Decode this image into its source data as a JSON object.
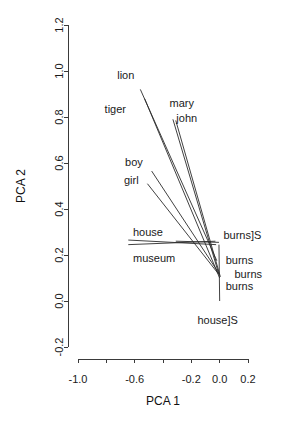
{
  "chart_data": {
    "type": "scatter",
    "title": "",
    "xlabel": "PCA 1",
    "ylabel": "PCA 2",
    "xlim": [
      -1.0,
      0.2
    ],
    "ylim": [
      -0.2,
      1.2
    ],
    "grid": false,
    "legend": "none",
    "xticks": [
      -1.0,
      -0.8,
      -0.6,
      -0.4,
      -0.2,
      0.0,
      0.2
    ],
    "xtick_labels": [
      "-1.0",
      "",
      "-0.6",
      "",
      "-0.2",
      "0.0",
      "0.2"
    ],
    "yticks": [
      -0.2,
      0.0,
      0.2,
      0.4,
      0.6,
      0.8,
      1.0,
      1.2
    ],
    "ytick_labels": [
      "-0.2",
      "0.0",
      "0.2",
      "0.4",
      "0.6",
      "0.8",
      "1.0",
      "1.2"
    ],
    "origin": {
      "x": -0.15,
      "y": 0.24
    },
    "points": [
      {
        "label": "lion",
        "x": -0.56,
        "y": 0.95,
        "label_dx": -6,
        "label_dy": -6,
        "anchor": "end",
        "vector_to": {
          "x": -0.06,
          "y": 0.13
        }
      },
      {
        "label": "tiger",
        "x": -0.53,
        "y": 0.91,
        "label_dx": -40,
        "label_dy": 18,
        "anchor": "start",
        "vector_to": {
          "x": -0.06,
          "y": 0.13
        }
      },
      {
        "label": "mary",
        "x": -0.34,
        "y": 0.82,
        "label_dx": -2,
        "label_dy": -8,
        "anchor": "start",
        "vector_to": {
          "x": -0.01,
          "y": 0.11
        }
      },
      {
        "label": "john",
        "x": -0.32,
        "y": 0.8,
        "label_dx": 2,
        "label_dy": 2,
        "anchor": "start",
        "vector_to": {
          "x": 0.0,
          "y": 0.1
        }
      },
      {
        "label": "boy",
        "x": -0.5,
        "y": 0.58,
        "label_dx": -6,
        "label_dy": -5,
        "anchor": "end",
        "vector_to": {
          "x": -0.02,
          "y": 0.14
        }
      },
      {
        "label": "girl",
        "x": -0.53,
        "y": 0.52,
        "label_dx": -6,
        "label_dy": 0,
        "anchor": "end",
        "vector_to": {
          "x": -0.02,
          "y": 0.12
        }
      },
      {
        "label": "house",
        "x": -0.64,
        "y": 0.27,
        "label_dx": 4,
        "label_dy": -6,
        "anchor": "start",
        "vector_to": {
          "x": -0.03,
          "y": 0.235
        }
      },
      {
        "label": "museum",
        "x": -0.64,
        "y": 0.25,
        "label_dx": 4,
        "label_dy": 16,
        "anchor": "start",
        "vector_to": {
          "x": -0.02,
          "y": 0.255
        }
      },
      {
        "label": "burns]S",
        "x": -0.03,
        "y": 0.265,
        "label_dx": 8,
        "label_dy": -4,
        "anchor": "start",
        "vector_to": null
      },
      {
        "label": "burns",
        "x": 0.0,
        "y": 0.19,
        "label_dx": 6,
        "label_dy": 4,
        "anchor": "start",
        "vector_to": null
      },
      {
        "label": "burns",
        "x": 0.02,
        "y": 0.13,
        "label_dx": 12,
        "label_dy": 4,
        "anchor": "start",
        "vector_to": null
      },
      {
        "label": "burns",
        "x": 0.0,
        "y": 0.08,
        "label_dx": 6,
        "label_dy": 4,
        "anchor": "start",
        "vector_to": null
      },
      {
        "label": "house]S",
        "x": 0.0,
        "y": -0.07,
        "label_dx": -2,
        "label_dy": 4,
        "anchor": "middle",
        "vector_to": null
      }
    ],
    "vectors": [
      {
        "name": "lion-vector",
        "x1": -0.56,
        "y1": 0.92,
        "x2": -0.02,
        "y2": 0.175
      },
      {
        "name": "tiger-vector",
        "x1": -0.53,
        "y1": 0.88,
        "x2": 0.0,
        "y2": 0.1
      },
      {
        "name": "mary-vector",
        "x1": -0.33,
        "y1": 0.79,
        "x2": -0.005,
        "y2": 0.115
      },
      {
        "name": "john-vector",
        "x1": -0.31,
        "y1": 0.785,
        "x2": 0.005,
        "y2": 0.105
      },
      {
        "name": "boy-vector",
        "x1": -0.48,
        "y1": 0.565,
        "x2": -0.005,
        "y2": 0.12
      },
      {
        "name": "girl-vector",
        "x1": -0.51,
        "y1": 0.51,
        "x2": -0.005,
        "y2": 0.115
      },
      {
        "name": "house-vector",
        "x1": -0.645,
        "y1": 0.265,
        "x2": -0.025,
        "y2": 0.245
      },
      {
        "name": "museum-vector",
        "x1": -0.645,
        "y1": 0.245,
        "x2": -0.03,
        "y2": 0.26
      },
      {
        "name": "burns-s-vector",
        "x1": -0.31,
        "y1": 0.26,
        "x2": -0.005,
        "y2": 0.255
      },
      {
        "name": "vertical-drop-vector",
        "x1": -0.005,
        "y1": 0.245,
        "x2": 0.0,
        "y2": 0.0
      }
    ]
  },
  "colors": {
    "background": "#ffffff",
    "axis": "#3a3a3a",
    "line": "#2b2b2b",
    "text": "#1a1a1a"
  }
}
